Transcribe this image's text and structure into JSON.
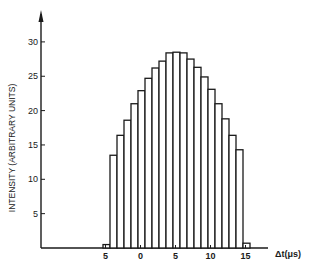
{
  "chart_data": {
    "type": "bar",
    "title": "",
    "xlabel": "Δt(μs)",
    "ylabel": "INTENSITY (ARBITRARY UNITS)",
    "x": [
      -5,
      -4,
      -3,
      -2,
      -1,
      0,
      1,
      2,
      3,
      4,
      5,
      6,
      7,
      8,
      9,
      10,
      11,
      12,
      13,
      14,
      15
    ],
    "values": [
      0.5,
      13.5,
      16.4,
      18.6,
      21.0,
      22.9,
      24.7,
      26.2,
      27.2,
      28.4,
      28.5,
      28.4,
      27.5,
      26.3,
      24.9,
      23.1,
      21.0,
      18.8,
      16.4,
      14.3,
      0.7
    ],
    "xlim": [
      -10,
      20
    ],
    "ylim": [
      0,
      33
    ],
    "x_ticks": [
      -5,
      0,
      5,
      10,
      15
    ],
    "x_tick_labels": [
      "5",
      "0",
      "5",
      "10",
      "15"
    ],
    "y_ticks": [
      5,
      10,
      15,
      20,
      25,
      30
    ],
    "y_tick_labels": [
      "5",
      "10",
      "15",
      "20",
      "25",
      "30"
    ],
    "grid": false,
    "legend": null,
    "bar_fill": "#ffffff",
    "bar_stroke": "#1a1a1a"
  }
}
